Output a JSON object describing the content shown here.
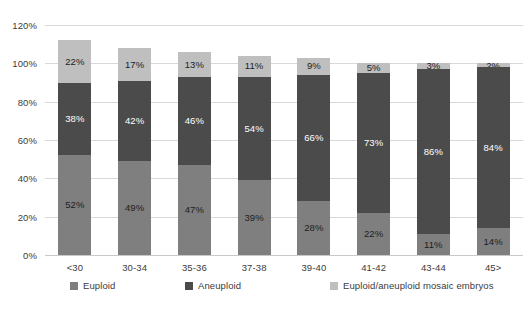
{
  "chart_data": {
    "type": "bar",
    "subtype": "stacked-bar",
    "title": "",
    "xlabel": "",
    "ylabel": "",
    "ylim": [
      0,
      120
    ],
    "y_ticks": [
      "0%",
      "20%",
      "40%",
      "60%",
      "80%",
      "100%",
      "120%"
    ],
    "y_tick_values": [
      0,
      20,
      40,
      60,
      80,
      100,
      120
    ],
    "grid": true,
    "legend_position": "bottom",
    "categories": [
      "<30",
      "30-34",
      "35-36",
      "37-38",
      "39-40",
      "41-42",
      "43-44",
      "45>"
    ],
    "series": [
      {
        "name": "Euploid",
        "color": "#7f7f7f",
        "values": [
          52,
          49,
          47,
          39,
          28,
          22,
          11,
          14
        ],
        "labels": [
          "52%",
          "49%",
          "47%",
          "39%",
          "28%",
          "22%",
          "11%",
          "14%"
        ]
      },
      {
        "name": "Aneuploid",
        "color": "#4b4b4b",
        "values": [
          38,
          42,
          46,
          54,
          66,
          73,
          86,
          84
        ],
        "labels": [
          "38%",
          "42%",
          "46%",
          "54%",
          "66%",
          "73%",
          "86%",
          "84%"
        ]
      },
      {
        "name": "Euploid/aneuploid mosaic embryos",
        "color": "#bfbfbf",
        "values": [
          22,
          17,
          13,
          11,
          9,
          5,
          3,
          2
        ],
        "labels": [
          "22%",
          "17%",
          "13%",
          "11%",
          "9%",
          "5%",
          "3%",
          "2%"
        ]
      }
    ],
    "totals": [
      112,
      108,
      106,
      104,
      103,
      100,
      100,
      100
    ]
  },
  "legend": {
    "items": [
      {
        "label": "Euploid",
        "color": "#7f7f7f"
      },
      {
        "label": "Aneuploid",
        "color": "#4b4b4b"
      },
      {
        "label": "Euploid/aneuploid mosaic embryos",
        "color": "#bfbfbf"
      }
    ]
  },
  "colors": {
    "euploid": "#7f7f7f",
    "aneuploid": "#4b4b4b",
    "mosaic": "#bfbfbf",
    "gridline": "#d9d9d9",
    "text": "#3b3b3b",
    "background": "#ffffff"
  }
}
